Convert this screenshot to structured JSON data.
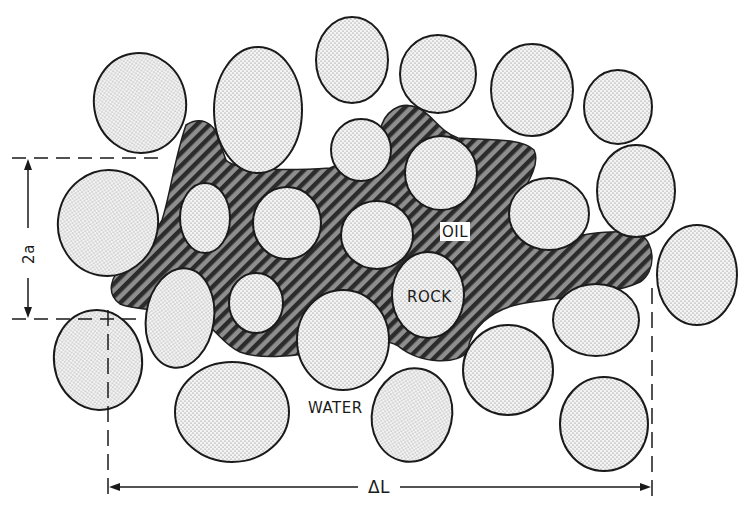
{
  "figure": {
    "type": "schematic",
    "labels": {
      "oil": "OIL",
      "rock": "ROCK",
      "water": "WATER",
      "height_dimension": "2a",
      "length_dimension": "ΔL"
    },
    "colors": {
      "background": "#ffffff",
      "outline": "#1a1a1a",
      "rock_fill": "#f2f2f2",
      "rock_stipple": "#777777",
      "oil_fill": "#3a3a3a",
      "oil_hatch": "#8a8a8a"
    },
    "dimensions": {
      "height": {
        "label": "2a",
        "y_top": 158,
        "y_bottom": 319,
        "x": 28
      },
      "length": {
        "label": "ΔL",
        "x_left": 108,
        "x_right": 652,
        "y": 487
      }
    }
  }
}
